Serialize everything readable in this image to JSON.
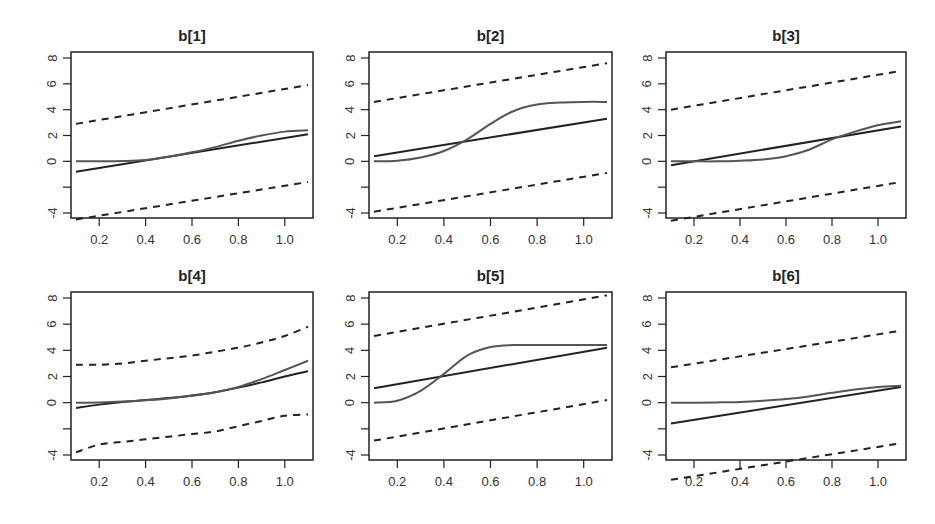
{
  "figure": {
    "layout": {
      "rows": 2,
      "cols": 3
    },
    "colors": {
      "fit_line": "#222222",
      "true_curve": "#555555",
      "band": "#222222",
      "frame": "#222222",
      "text": "#333333"
    }
  },
  "chart_data": [
    {
      "type": "line",
      "title": "b[1]",
      "xlabel": "",
      "ylabel": "",
      "xlim": [
        0.1,
        1.1
      ],
      "ylim": [
        -4.3,
        8.3
      ],
      "xticks": [
        0.2,
        0.4,
        0.6,
        0.8,
        1.0
      ],
      "xtick_labels": [
        "0.2",
        "0.4",
        "0.6",
        "0.8",
        "1.0"
      ],
      "yticks": [
        -4,
        -2,
        0,
        2,
        4,
        6,
        8
      ],
      "ytick_labels": [
        "-4",
        "",
        "0",
        "2",
        "4",
        "6",
        "8"
      ],
      "grid": false,
      "legend": null,
      "series": [
        {
          "name": "upper-band",
          "style": "dashed",
          "x": [
            0.1,
            1.1
          ],
          "y": [
            2.9,
            5.9
          ]
        },
        {
          "name": "fit",
          "style": "solid",
          "x": [
            0.1,
            1.1
          ],
          "y": [
            -0.8,
            2.1
          ]
        },
        {
          "name": "true-curve",
          "style": "solid-gray",
          "x": [
            0.1,
            0.2,
            0.3,
            0.4,
            0.5,
            0.6,
            0.7,
            0.8,
            0.9,
            1.0,
            1.1
          ],
          "y": [
            0.0,
            0.0,
            0.02,
            0.1,
            0.35,
            0.7,
            1.1,
            1.6,
            2.0,
            2.3,
            2.4
          ]
        },
        {
          "name": "lower-band",
          "style": "dashed",
          "x": [
            0.1,
            1.1
          ],
          "y": [
            -4.5,
            -1.6
          ]
        }
      ]
    },
    {
      "type": "line",
      "title": "b[2]",
      "xlabel": "",
      "ylabel": "",
      "xlim": [
        0.1,
        1.1
      ],
      "ylim": [
        -4.3,
        8.3
      ],
      "xticks": [
        0.2,
        0.4,
        0.6,
        0.8,
        1.0
      ],
      "xtick_labels": [
        "0.2",
        "0.4",
        "0.6",
        "0.8",
        "1.0"
      ],
      "yticks": [
        -4,
        -2,
        0,
        2,
        4,
        6,
        8
      ],
      "ytick_labels": [
        "-4",
        "",
        "0",
        "2",
        "4",
        "6",
        "8"
      ],
      "grid": false,
      "legend": null,
      "series": [
        {
          "name": "upper-band",
          "style": "dashed",
          "x": [
            0.1,
            1.1
          ],
          "y": [
            4.6,
            7.6
          ]
        },
        {
          "name": "fit",
          "style": "solid",
          "x": [
            0.1,
            1.1
          ],
          "y": [
            0.4,
            3.3
          ]
        },
        {
          "name": "true-curve",
          "style": "solid-gray",
          "x": [
            0.1,
            0.2,
            0.3,
            0.4,
            0.5,
            0.6,
            0.7,
            0.8,
            0.9,
            1.0,
            1.1
          ],
          "y": [
            0.0,
            0.05,
            0.3,
            0.8,
            1.7,
            2.9,
            3.9,
            4.4,
            4.55,
            4.6,
            4.6
          ]
        },
        {
          "name": "lower-band",
          "style": "dashed",
          "x": [
            0.1,
            1.1
          ],
          "y": [
            -3.9,
            -0.9
          ]
        }
      ]
    },
    {
      "type": "line",
      "title": "b[3]",
      "xlabel": "",
      "ylabel": "",
      "xlim": [
        0.1,
        1.1
      ],
      "ylim": [
        -4.3,
        8.3
      ],
      "xticks": [
        0.2,
        0.4,
        0.6,
        0.8,
        1.0
      ],
      "xtick_labels": [
        "0.2",
        "0.4",
        "0.6",
        "0.8",
        "1.0"
      ],
      "yticks": [
        -4,
        -2,
        0,
        2,
        4,
        6,
        8
      ],
      "ytick_labels": [
        "-4",
        "",
        "0",
        "2",
        "4",
        "6",
        "8"
      ],
      "grid": false,
      "legend": null,
      "series": [
        {
          "name": "upper-band",
          "style": "dashed",
          "x": [
            0.1,
            1.1
          ],
          "y": [
            4.0,
            7.0
          ]
        },
        {
          "name": "fit",
          "style": "solid",
          "x": [
            0.1,
            1.1
          ],
          "y": [
            -0.3,
            2.7
          ]
        },
        {
          "name": "true-curve",
          "style": "solid-gray",
          "x": [
            0.1,
            0.2,
            0.3,
            0.4,
            0.5,
            0.6,
            0.7,
            0.8,
            0.9,
            1.0,
            1.1
          ],
          "y": [
            0.0,
            0.0,
            0.0,
            0.05,
            0.15,
            0.4,
            0.9,
            1.7,
            2.3,
            2.8,
            3.1
          ]
        },
        {
          "name": "lower-band",
          "style": "dashed",
          "x": [
            0.1,
            1.1
          ],
          "y": [
            -4.6,
            -1.6
          ]
        }
      ]
    },
    {
      "type": "line",
      "title": "b[4]",
      "xlabel": "",
      "ylabel": "",
      "xlim": [
        0.1,
        1.1
      ],
      "ylim": [
        -4.3,
        8.3
      ],
      "xticks": [
        0.2,
        0.4,
        0.6,
        0.8,
        1.0
      ],
      "xtick_labels": [
        "0.2",
        "0.4",
        "0.6",
        "0.8",
        "1.0"
      ],
      "yticks": [
        -4,
        -2,
        0,
        2,
        4,
        6,
        8
      ],
      "ytick_labels": [
        "-4",
        "",
        "0",
        "2",
        "4",
        "6",
        "8"
      ],
      "grid": false,
      "legend": null,
      "series": [
        {
          "name": "upper-band",
          "style": "dashed",
          "x": [
            0.1,
            0.2,
            0.3,
            0.4,
            0.5,
            0.6,
            0.7,
            0.8,
            0.9,
            1.0,
            1.1
          ],
          "y": [
            2.9,
            2.9,
            3.0,
            3.2,
            3.4,
            3.6,
            3.9,
            4.2,
            4.6,
            5.1,
            5.8
          ]
        },
        {
          "name": "fit",
          "style": "solid",
          "x": [
            0.1,
            0.2,
            0.3,
            0.4,
            0.5,
            0.6,
            0.7,
            0.8,
            0.9,
            1.0,
            1.1
          ],
          "y": [
            -0.4,
            -0.15,
            0.05,
            0.2,
            0.35,
            0.55,
            0.8,
            1.15,
            1.55,
            2.0,
            2.4
          ]
        },
        {
          "name": "true-curve",
          "style": "solid-gray",
          "x": [
            0.1,
            0.2,
            0.3,
            0.4,
            0.5,
            0.6,
            0.7,
            0.8,
            0.9,
            1.0,
            1.1
          ],
          "y": [
            0.0,
            0.02,
            0.08,
            0.18,
            0.32,
            0.52,
            0.8,
            1.2,
            1.8,
            2.5,
            3.2
          ]
        },
        {
          "name": "lower-band",
          "style": "dashed",
          "x": [
            0.1,
            0.2,
            0.3,
            0.4,
            0.5,
            0.6,
            0.7,
            0.8,
            0.9,
            1.0,
            1.1
          ],
          "y": [
            -3.8,
            -3.2,
            -3.0,
            -2.8,
            -2.6,
            -2.4,
            -2.2,
            -1.8,
            -1.4,
            -1.0,
            -0.9
          ]
        }
      ]
    },
    {
      "type": "line",
      "title": "b[5]",
      "xlabel": "",
      "ylabel": "",
      "xlim": [
        0.1,
        1.1
      ],
      "ylim": [
        -4.3,
        8.3
      ],
      "xticks": [
        0.2,
        0.4,
        0.6,
        0.8,
        1.0
      ],
      "xtick_labels": [
        "0.2",
        "0.4",
        "0.6",
        "0.8",
        "1.0"
      ],
      "yticks": [
        -4,
        -2,
        0,
        2,
        4,
        6,
        8
      ],
      "ytick_labels": [
        "-4",
        "",
        "0",
        "2",
        "4",
        "6",
        "8"
      ],
      "grid": false,
      "legend": null,
      "series": [
        {
          "name": "upper-band",
          "style": "dashed",
          "x": [
            0.1,
            1.1
          ],
          "y": [
            5.1,
            8.2
          ]
        },
        {
          "name": "fit",
          "style": "solid",
          "x": [
            0.1,
            1.1
          ],
          "y": [
            1.1,
            4.2
          ]
        },
        {
          "name": "true-curve",
          "style": "solid-gray",
          "x": [
            0.1,
            0.2,
            0.3,
            0.4,
            0.5,
            0.6,
            0.7,
            0.8,
            0.9,
            1.0,
            1.1
          ],
          "y": [
            0.0,
            0.15,
            0.9,
            2.2,
            3.6,
            4.25,
            4.4,
            4.4,
            4.4,
            4.4,
            4.4
          ]
        },
        {
          "name": "lower-band",
          "style": "dashed",
          "x": [
            0.1,
            1.1
          ],
          "y": [
            -2.9,
            0.2
          ]
        }
      ]
    },
    {
      "type": "line",
      "title": "b[6]",
      "xlabel": "",
      "ylabel": "",
      "xlim": [
        0.1,
        1.1
      ],
      "ylim": [
        -4.3,
        8.3
      ],
      "xticks": [
        0.2,
        0.4,
        0.6,
        0.8,
        1.0
      ],
      "xtick_labels": [
        "0.2",
        "0.4",
        "0.6",
        "0.8",
        "1.0"
      ],
      "yticks": [
        -4,
        -2,
        0,
        2,
        4,
        6,
        8
      ],
      "ytick_labels": [
        "-4",
        "",
        "0",
        "2",
        "4",
        "6",
        "8"
      ],
      "grid": false,
      "legend": null,
      "series": [
        {
          "name": "upper-band",
          "style": "dashed",
          "x": [
            0.1,
            1.1
          ],
          "y": [
            2.7,
            5.5
          ]
        },
        {
          "name": "fit",
          "style": "solid",
          "x": [
            0.1,
            1.1
          ],
          "y": [
            -1.6,
            1.2
          ]
        },
        {
          "name": "true-curve",
          "style": "solid-gray",
          "x": [
            0.1,
            0.2,
            0.3,
            0.4,
            0.5,
            0.6,
            0.7,
            0.8,
            0.9,
            1.0,
            1.1
          ],
          "y": [
            0.0,
            0.0,
            0.02,
            0.06,
            0.15,
            0.28,
            0.48,
            0.75,
            1.0,
            1.2,
            1.3
          ]
        },
        {
          "name": "lower-band",
          "style": "dashed",
          "x": [
            0.1,
            1.1
          ],
          "y": [
            -5.9,
            -3.1
          ]
        }
      ]
    }
  ]
}
